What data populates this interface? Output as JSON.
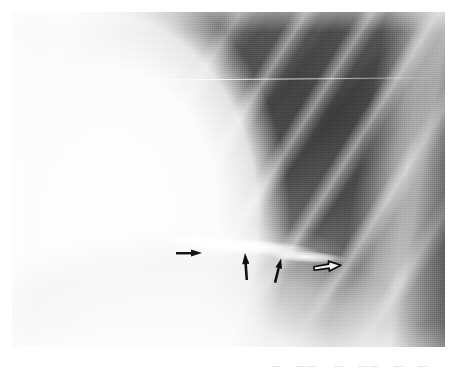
{
  "page": {
    "background_color": "#ffffff",
    "width": 461,
    "height": 371
  },
  "figure": {
    "type": "chest-radiograph",
    "plate": {
      "left": 12,
      "top": 12,
      "width": 433,
      "height": 335,
      "border_color": "#bdbdbd"
    },
    "regions": [
      {
        "name": "mediastinum",
        "description": "bright homogeneous soft-tissue density occupying the left third",
        "tone": "#fafafa"
      },
      {
        "name": "lung-field",
        "description": "dark aerated lung occupying the upper right",
        "tone": "#4c4c4c"
      },
      {
        "name": "ribs",
        "description": "bright oblique rib bands running upper-left to lower-right",
        "tone": "#ffffff"
      },
      {
        "name": "scapula-band",
        "description": "bright vertical bony band along the right margin",
        "tone": "#f0f0f0"
      },
      {
        "name": "diaphragm",
        "description": "bright dome sweeping across the lower field",
        "tone": "#fcfcfc"
      },
      {
        "name": "lesion",
        "description": "horizontal curvilinear bright opacity in the mid field",
        "tone": "#ffffff"
      },
      {
        "name": "scratch",
        "description": "thin horizontal emulsion scratch in the upper third",
        "tone": "#ffffff"
      }
    ],
    "annotations": {
      "count": 4,
      "markers": [
        {
          "id": "arrow-1",
          "shape": "solid-arrow",
          "direction": "right",
          "fill": "#151515",
          "x": 163,
          "y": 233,
          "length": 25,
          "head": 9,
          "rotation": 0
        },
        {
          "id": "arrow-2",
          "shape": "solid-arrow",
          "direction": "up",
          "fill": "#121212",
          "x": 226,
          "y": 240,
          "length": 27,
          "head": 9,
          "rotation": -4
        },
        {
          "id": "arrow-3",
          "shape": "solid-arrow",
          "direction": "up",
          "fill": "#121212",
          "x": 258,
          "y": 245,
          "length": 25,
          "head": 9,
          "rotation": 14
        },
        {
          "id": "arrow-4",
          "shape": "outline-arrow",
          "direction": "right",
          "fill": "#f2f2f2",
          "stroke": "#0d0d0d",
          "x": 300,
          "y": 247,
          "length": 27,
          "head": 9,
          "rotation": -6
        }
      ]
    }
  },
  "caption": {
    "visible": false,
    "note": "Only the clipped tops of the next line of body text are visible along the bottom edge.",
    "fragments": [
      {
        "text": "—",
        "left": 272
      },
      {
        "text": "— —",
        "left": 296
      },
      {
        "text": "—",
        "left": 334
      },
      {
        "text": "— —",
        "left": 358
      },
      {
        "text": "—",
        "left": 394
      },
      {
        "text": "—",
        "left": 418
      }
    ]
  }
}
